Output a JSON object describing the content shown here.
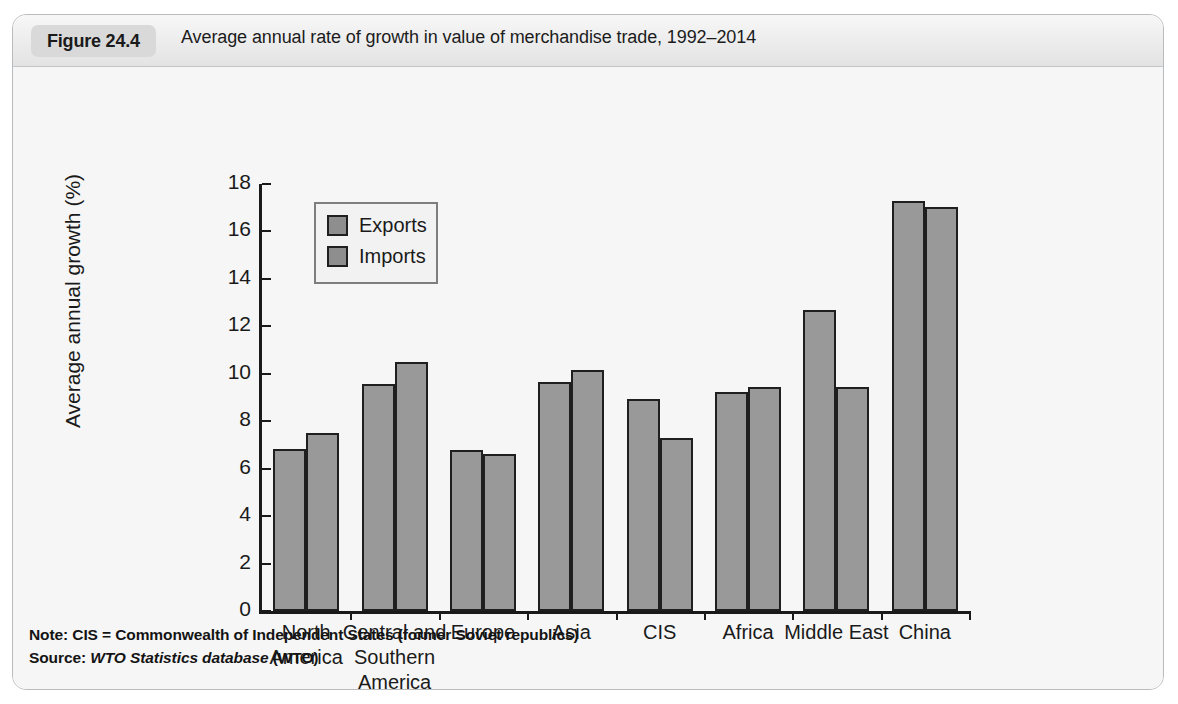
{
  "figure": {
    "number_label": "Figure 24.4",
    "title": "Average annual rate of growth in value of merchandise trade, 1992–2014",
    "note": "Note: CIS = Commonwealth of Independent States (former Soviet republics)",
    "source_prefix": "Source: ",
    "source_italic": "WTO Statistics database",
    "source_suffix": " (WTO)"
  },
  "chart_data": {
    "type": "bar",
    "title": "Average annual rate of growth in value of merchandise trade, 1992–2014",
    "xlabel": "",
    "ylabel": "Average annual growth (%)",
    "ylim": [
      0,
      18
    ],
    "yticks": [
      0,
      2,
      4,
      6,
      8,
      10,
      12,
      14,
      16,
      18
    ],
    "ytick_labels": [
      "0",
      "2",
      "4",
      "6",
      "8",
      "10",
      "12",
      "14",
      "16",
      "18"
    ],
    "grid": false,
    "legend_position": "upper-left-inside",
    "categories": [
      "North\nAmerica",
      "Central and\nSouthern\nAmerica",
      "Europe",
      "Asia",
      "CIS",
      "Africa",
      "Middle East",
      "China"
    ],
    "series": [
      {
        "name": "Exports",
        "color": "#999999",
        "values": [
          6.85,
          9.55,
          6.8,
          9.65,
          8.95,
          9.25,
          12.7,
          17.3
        ]
      },
      {
        "name": "Imports",
        "color": "#999999",
        "values": [
          7.5,
          10.5,
          6.6,
          10.15,
          7.3,
          9.45,
          9.45,
          17.05
        ]
      }
    ]
  }
}
